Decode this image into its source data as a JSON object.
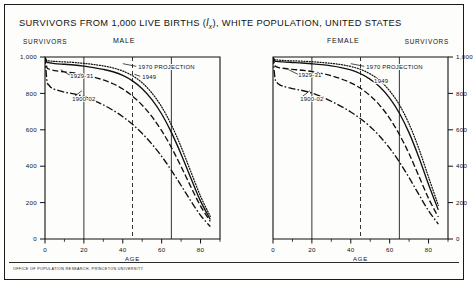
{
  "title": {
    "pre": "SURVIVORS  FROM  1,000 LIVE BIRTHS (",
    "symbol": "l",
    "symbol_sub": "x",
    "post": "), WHITE POPULATION, UNITED STATES"
  },
  "headers": {
    "survivors_left": "SURVIVORS",
    "male": "MALE",
    "female": "FEMALE",
    "survivors_right": "SURVIVORS"
  },
  "footer": "OFFICE OF POPULATION RESEARCH, PRINCETON UNIVERSITY",
  "colors": {
    "ink": "#111111",
    "frame": "#1a1a1a",
    "paper": "#fdfdfb"
  },
  "axis_label": "AGE",
  "chart_data": {
    "type": "line",
    "title": "SURVIVORS FROM 1,000 LIVE BIRTHS (lx), WHITE POPULATION, UNITED STATES",
    "xlabel": "AGE",
    "ylabel": "SURVIVORS",
    "xlim": [
      0,
      90
    ],
    "ylim": [
      0,
      1000
    ],
    "xticks": [
      0,
      20,
      40,
      60,
      80
    ],
    "xticklabels": [
      "0",
      "20",
      "40",
      "60",
      "80"
    ],
    "xminorticks": [
      10,
      30,
      50,
      70,
      90
    ],
    "yticks": [
      0,
      200,
      400,
      600,
      800,
      1000
    ],
    "yticklabels": [
      "0",
      "200",
      "400",
      "600",
      "800",
      "1,000"
    ],
    "grid": false,
    "reference_lines": [
      {
        "x": 20,
        "style": "solid"
      },
      {
        "x": 45,
        "style": "dashed"
      },
      {
        "x": 65,
        "style": "solid"
      }
    ],
    "legend": "inline-annotations",
    "panels": [
      {
        "name": "MALE",
        "annotations": [
          {
            "text": "1900-02",
            "x": 14,
            "y": 760
          },
          {
            "text": "1929-31",
            "x": 13,
            "y": 885
          },
          {
            "text": "1949",
            "x": 50,
            "y": 880
          },
          {
            "text": "1970 PROJECTION",
            "x": 48,
            "y": 935
          }
        ],
        "series": [
          {
            "name": "1900-02",
            "style": "dash-dot",
            "x": [
              0,
              1,
              2,
              3,
              5,
              10,
              15,
              20,
              25,
              30,
              35,
              40,
              45,
              50,
              55,
              60,
              65,
              70,
              75,
              80,
              85
            ],
            "y": [
              1000,
              870,
              845,
              833,
              822,
              807,
              797,
              783,
              762,
              737,
              707,
              672,
              630,
              580,
              521,
              454,
              377,
              294,
              209,
              130,
              68
            ]
          },
          {
            "name": "1929-31",
            "style": "dashed",
            "x": [
              0,
              1,
              2,
              3,
              5,
              10,
              15,
              20,
              25,
              30,
              35,
              40,
              45,
              50,
              55,
              60,
              65,
              70,
              75,
              80,
              85
            ],
            "y": [
              1000,
              942,
              934,
              930,
              925,
              918,
              912,
              903,
              890,
              874,
              853,
              824,
              785,
              735,
              672,
              595,
              503,
              398,
              287,
              181,
              97
            ]
          },
          {
            "name": "1949",
            "style": "solid",
            "x": [
              0,
              1,
              2,
              3,
              5,
              10,
              15,
              20,
              25,
              30,
              35,
              40,
              45,
              50,
              55,
              60,
              65,
              70,
              75,
              80,
              85
            ],
            "y": [
              1000,
              972,
              969,
              967,
              964,
              960,
              956,
              950,
              942,
              932,
              919,
              899,
              869,
              826,
              766,
              687,
              586,
              466,
              335,
              208,
              108
            ]
          },
          {
            "name": "1970 PROJECTION",
            "style": "dotted",
            "x": [
              0,
              1,
              2,
              3,
              5,
              10,
              15,
              20,
              25,
              30,
              35,
              40,
              45,
              50,
              55,
              60,
              65,
              70,
              75,
              80,
              85
            ],
            "y": [
              1000,
              981,
              979,
              978,
              976,
              973,
              970,
              965,
              959,
              951,
              940,
              923,
              897,
              858,
              802,
              726,
              627,
              506,
              370,
              235,
              124
            ]
          }
        ]
      },
      {
        "name": "FEMALE",
        "annotations": [
          {
            "text": "1900-02",
            "x": 14,
            "y": 760
          },
          {
            "text": "1929-31",
            "x": 13,
            "y": 890
          },
          {
            "text": "1949",
            "x": 52,
            "y": 855
          },
          {
            "text": "1970 PROJECTION",
            "x": 48,
            "y": 935
          }
        ],
        "series": [
          {
            "name": "1900-02",
            "style": "dash-dot",
            "x": [
              0,
              1,
              2,
              3,
              5,
              10,
              15,
              20,
              25,
              30,
              35,
              40,
              45,
              50,
              55,
              60,
              65,
              70,
              75,
              80,
              85
            ],
            "y": [
              1000,
              885,
              861,
              850,
              840,
              826,
              816,
              802,
              782,
              757,
              729,
              698,
              661,
              617,
              563,
              499,
              423,
              337,
              245,
              155,
              82
            ]
          },
          {
            "name": "1929-31",
            "style": "dashed",
            "x": [
              0,
              1,
              2,
              3,
              5,
              10,
              15,
              20,
              25,
              30,
              35,
              40,
              45,
              50,
              55,
              60,
              65,
              70,
              75,
              80,
              85
            ],
            "y": [
              1000,
              953,
              946,
              942,
              938,
              932,
              927,
              920,
              910,
              897,
              880,
              858,
              828,
              787,
              733,
              663,
              574,
              468,
              346,
              223,
              121
            ]
          },
          {
            "name": "1949",
            "style": "solid",
            "x": [
              0,
              1,
              2,
              3,
              5,
              10,
              15,
              20,
              25,
              30,
              35,
              40,
              45,
              50,
              55,
              60,
              65,
              70,
              75,
              80,
              85
            ],
            "y": [
              1000,
              978,
              976,
              975,
              973,
              970,
              967,
              963,
              958,
              951,
              942,
              929,
              908,
              878,
              835,
              774,
              691,
              583,
              449,
              300,
              160
            ]
          },
          {
            "name": "1970 PROJECTION",
            "style": "dotted",
            "x": [
              0,
              1,
              2,
              3,
              5,
              10,
              15,
              20,
              25,
              30,
              35,
              40,
              45,
              50,
              55,
              60,
              65,
              70,
              75,
              80,
              85
            ],
            "y": [
              1000,
              985,
              984,
              983,
              981,
              979,
              977,
              974,
              970,
              965,
              958,
              948,
              932,
              907,
              870,
              814,
              737,
              632,
              497,
              340,
              185
            ]
          }
        ]
      }
    ]
  }
}
